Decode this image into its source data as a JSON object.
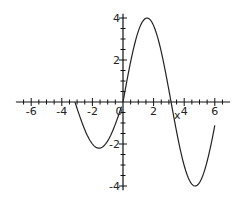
{
  "chart_data": {
    "type": "line",
    "title": "",
    "xlabel": "x",
    "ylabel": "",
    "xlim": [
      -7,
      7
    ],
    "ylim": [
      -4.2,
      4.2
    ],
    "grid": false,
    "legend": null,
    "x_ticks": [
      -6,
      -4,
      -2,
      0,
      2,
      4,
      6
    ],
    "x_tick_labels": [
      "-6",
      "-4",
      "-2",
      "0",
      "2",
      "4",
      "6"
    ],
    "y_ticks": [
      -4,
      -2,
      2,
      4
    ],
    "y_tick_labels": [
      "-4",
      "-2",
      "2",
      "4"
    ],
    "minor_tick_step": 0.5,
    "series": [
      {
        "name": "left piece",
        "description": "approx 2.2*sin(x) on [-3.14, 0)",
        "x": [
          -3.14,
          -2.5,
          -2.0,
          -1.6,
          -1.2,
          -0.8,
          -0.4,
          -0.1
        ],
        "y": [
          0.0,
          -1.3,
          -2.0,
          -2.2,
          -2.05,
          -1.6,
          -0.85,
          -0.3
        ]
      },
      {
        "name": "right piece",
        "description": "approx 4*sin(x) on [0, 6]",
        "x": [
          0,
          0.5,
          1.0,
          1.57,
          2.0,
          2.5,
          3.14,
          3.7,
          4.2,
          4.71,
          5.2,
          5.7,
          6.0
        ],
        "y": [
          0,
          1.9,
          3.4,
          4.0,
          3.6,
          2.4,
          0.0,
          -2.1,
          -3.5,
          -4.0,
          -3.5,
          -2.2,
          -1.1
        ]
      }
    ]
  },
  "axis": {
    "x_label": "x",
    "zero_label": "0"
  }
}
